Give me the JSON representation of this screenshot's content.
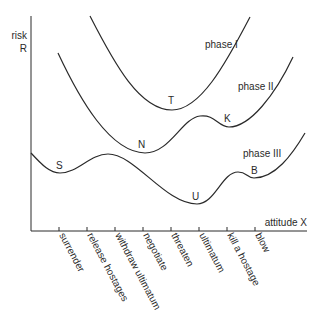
{
  "axes": {
    "y_label_line1": "risk",
    "y_label_line2": "R",
    "x_label": "attitude X"
  },
  "ticks": [
    {
      "label": "surrender"
    },
    {
      "label": "release hostages"
    },
    {
      "label": "withdraw ultimatum"
    },
    {
      "label": "negotiate"
    },
    {
      "label": "threaten"
    },
    {
      "label": "ultimatum"
    },
    {
      "label": "kill a hostage"
    },
    {
      "label": "blow"
    }
  ],
  "curves": [
    {
      "name": "phase I",
      "points": [
        {
          "label": "T"
        }
      ]
    },
    {
      "name": "phase II",
      "points": [
        {
          "label": "N"
        },
        {
          "label": "K"
        }
      ]
    },
    {
      "name": "phase III",
      "points": [
        {
          "label": "S"
        },
        {
          "label": "U"
        },
        {
          "label": "B"
        }
      ]
    }
  ]
}
